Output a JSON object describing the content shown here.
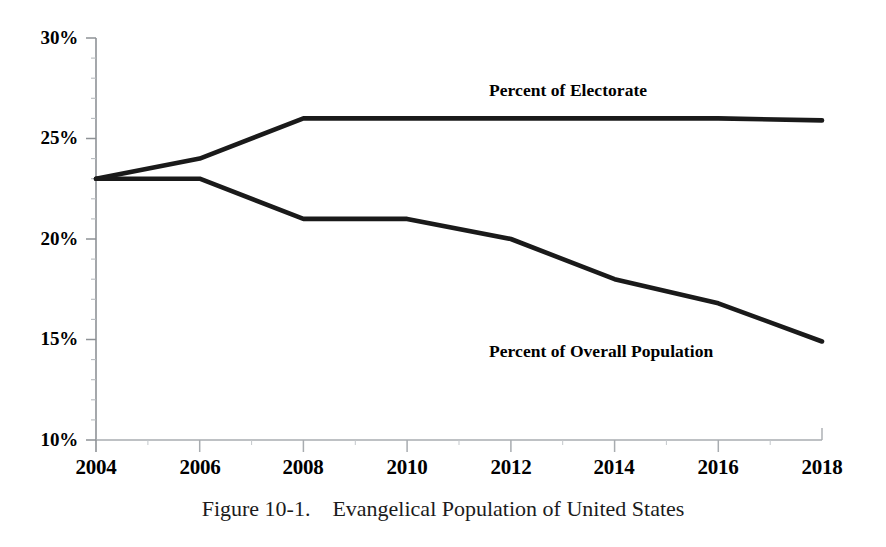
{
  "chart_data": {
    "type": "line",
    "title": "",
    "caption": "Figure 10-1.    Evangelical Population of United States",
    "xlabel": "",
    "ylabel": "",
    "x": [
      2004,
      2006,
      2008,
      2010,
      2012,
      2014,
      2016,
      2018
    ],
    "xtick_labels": [
      "2004",
      "2006",
      "2008",
      "2010",
      "2012",
      "2014",
      "2016",
      "2018"
    ],
    "ytick_labels": [
      "30%",
      "25%",
      "20%",
      "15%",
      "10%"
    ],
    "ytick_values": [
      30,
      25,
      20,
      15,
      10
    ],
    "xlim": [
      2004,
      2018
    ],
    "ylim": [
      10,
      30
    ],
    "grid": false,
    "minor_ticks": true,
    "minor_tick_step": 1,
    "legend_position": "inline-annotations",
    "line_color": "#1a1a1a",
    "line_width": 4,
    "series": [
      {
        "name": "Percent of Electorate",
        "label_x": 2017,
        "values": [
          23,
          24,
          26,
          26,
          26,
          26,
          26,
          25.9
        ]
      },
      {
        "name": "Percent of Overall Population",
        "label_x": 2015,
        "values": [
          23,
          23,
          21,
          21,
          20,
          18,
          16.8,
          14.9
        ]
      }
    ],
    "annotations": [
      {
        "text": "Percent of Electorate",
        "series": 0
      },
      {
        "text": "Percent of Overall Population",
        "series": 1
      }
    ]
  },
  "labels": {
    "electorate": "Percent of Electorate",
    "overall_population": "Percent of Overall Population"
  },
  "axis": {
    "y": {
      "t30": "30%",
      "t25": "25%",
      "t20": "20%",
      "t15": "15%",
      "t10": "10%"
    },
    "x": {
      "t2004": "2004",
      "t2006": "2006",
      "t2008": "2008",
      "t2010": "2010",
      "t2012": "2012",
      "t2014": "2014",
      "t2016": "2016",
      "t2018": "2018"
    }
  },
  "caption": {
    "text": "Figure 10-1.    Evangelical Population of United States"
  }
}
